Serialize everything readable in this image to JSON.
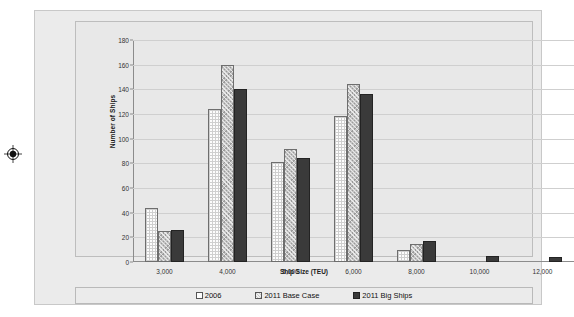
{
  "chart_data": {
    "type": "bar",
    "title": "",
    "xlabel": "Ship Size (TEU)",
    "ylabel": "Number of Ships",
    "categories": [
      "3,000",
      "4,000",
      "5,000",
      "6,000",
      "8,000",
      "10,000",
      "12,000"
    ],
    "series": [
      {
        "name": "2006",
        "values": [
          44,
          124,
          81,
          118,
          10,
          0,
          0
        ]
      },
      {
        "name": "2011 Base Case",
        "values": [
          25,
          160,
          92,
          144,
          15,
          0,
          0
        ]
      },
      {
        "name": "2011 Big Ships",
        "values": [
          26,
          140,
          84,
          136,
          17,
          5,
          4
        ]
      }
    ],
    "ylim": [
      0,
      180
    ],
    "ytick_step": 20,
    "yticks": [
      0,
      20,
      40,
      60,
      80,
      100,
      120,
      140,
      160,
      180
    ],
    "grid": true,
    "legend_position": "bottom"
  },
  "legend": {
    "items": [
      {
        "label": "2006",
        "swatch": "white-grid"
      },
      {
        "label": "2011 Base Case",
        "swatch": "gray-checker"
      },
      {
        "label": "2011 Big Ships",
        "swatch": "dark-solid"
      }
    ]
  },
  "marks": {
    "registration": "registration-target-icon"
  }
}
